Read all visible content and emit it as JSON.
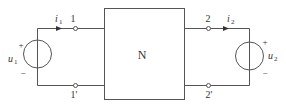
{
  "diagram": {
    "type": "two-port network circuit",
    "network": {
      "label": "N"
    },
    "port1": {
      "terminal_top": "1",
      "terminal_bottom": "1'",
      "current": {
        "symbol": "i",
        "subscript": "1"
      },
      "source": {
        "symbol": "u",
        "subscript": "1",
        "plus": "+",
        "minus": "−"
      }
    },
    "port2": {
      "terminal_top": "2",
      "terminal_bottom": "2'",
      "current": {
        "symbol": "i",
        "subscript": "2"
      },
      "source": {
        "symbol": "u",
        "subscript": "2",
        "plus": "+",
        "minus": "−"
      }
    },
    "colors": {
      "line": "#555555",
      "text": "#333333",
      "background": "#ffffff"
    }
  }
}
